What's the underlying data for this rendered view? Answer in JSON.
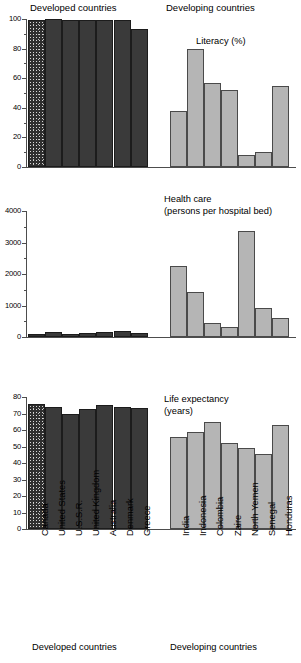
{
  "figure": {
    "group_headers": [
      {
        "label": "Developed countries"
      },
      {
        "label": "Developing countries"
      }
    ],
    "footer_groups": [
      {
        "label": "Developed countries"
      },
      {
        "label": "Developing countries"
      }
    ],
    "categories_developed": [
      "Canada",
      "United States",
      "U.S.S.R.",
      "United Kingdom",
      "Australia",
      "Denmark",
      "Greece"
    ],
    "categories_developing": [
      "India",
      "Indonesia",
      "Colombia",
      "Zaire",
      "North Yemen",
      "Senegal",
      "Honduras"
    ],
    "colors": {
      "developed_bar": "#3a3a3a",
      "developing_bar": "#b5b5b5",
      "axis": "#4d4d4d",
      "text": "#000000",
      "background": "#ffffff"
    }
  },
  "chart_data": [
    {
      "type": "bar",
      "title": "Literacy (%)",
      "title_lines": [
        "Literacy (%)"
      ],
      "xlabel": "",
      "ylabel": "",
      "ylim": [
        0,
        100
      ],
      "yticks": [
        0,
        20,
        40,
        60,
        80,
        100
      ],
      "ytick_labels": [
        "0",
        "20",
        "40",
        "60",
        "80",
        "100"
      ],
      "yminor_step": 10,
      "grid": false,
      "legend": "none",
      "categories": [
        "Canada",
        "United States",
        "U.S.S.R.",
        "United Kingdom",
        "Australia",
        "Denmark",
        "Greece",
        "India",
        "Indonesia",
        "Colombia",
        "Zaire",
        "North Yemen",
        "Senegal",
        "Honduras"
      ],
      "series": [
        {
          "name": "Developed countries",
          "values": [
            99,
            100,
            99,
            99,
            99,
            99,
            93
          ]
        },
        {
          "name": "Developing countries",
          "values": [
            38,
            80,
            57,
            52,
            8,
            10,
            55
          ]
        }
      ]
    },
    {
      "type": "bar",
      "title": "Health care (persons per hospital bed)",
      "title_lines": [
        "Health care",
        "(persons per hospital bed)"
      ],
      "xlabel": "",
      "ylabel": "",
      "ylim": [
        0,
        4000
      ],
      "yticks": [
        0,
        1000,
        2000,
        3000,
        4000
      ],
      "ytick_labels": [
        "0",
        "1000",
        "2000",
        "3000",
        "4000"
      ],
      "yminor_step": 500,
      "grid": false,
      "legend": "none",
      "categories": [
        "Canada",
        "United States",
        "U.S.S.R.",
        "United Kingdom",
        "Australia",
        "Denmark",
        "Greece",
        "India",
        "Indonesia",
        "Colombia",
        "Zaire",
        "North Yemen",
        "Senegal",
        "Honduras"
      ],
      "series": [
        {
          "name": "Developed countries",
          "values": [
            110,
            170,
            80,
            130,
            150,
            200,
            130
          ]
        },
        {
          "name": "Developing countries",
          "values": [
            2250,
            1430,
            440,
            310,
            3350,
            930,
            590
          ]
        }
      ]
    },
    {
      "type": "bar",
      "title": "Life expectancy (years)",
      "title_lines": [
        "Life expectancy",
        "(years)"
      ],
      "xlabel": "",
      "ylabel": "",
      "ylim": [
        0,
        80
      ],
      "yticks": [
        0,
        10,
        20,
        30,
        40,
        50,
        60,
        70,
        80
      ],
      "ytick_labels": [
        "0",
        "10",
        "20",
        "30",
        "40",
        "50",
        "60",
        "70",
        "80"
      ],
      "yminor_step": 10,
      "grid": false,
      "legend": "none",
      "categories": [
        "Canada",
        "United States",
        "U.S.S.R.",
        "United Kingdom",
        "Australia",
        "Denmark",
        "Greece",
        "India",
        "Indonesia",
        "Colombia",
        "Zaire",
        "North Yemen",
        "Senegal",
        "Honduras"
      ],
      "series": [
        {
          "name": "Developed countries",
          "values": [
            76,
            74,
            70,
            73,
            75,
            74,
            73.5
          ]
        },
        {
          "name": "Developing countries",
          "values": [
            56,
            58.5,
            65,
            52,
            49,
            45.5,
            63
          ]
        }
      ]
    }
  ]
}
